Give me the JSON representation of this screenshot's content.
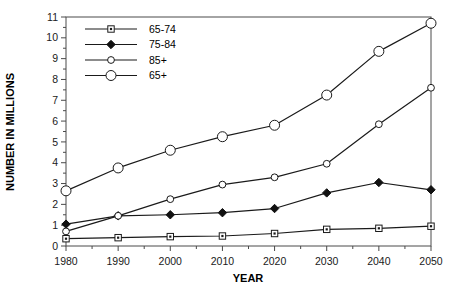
{
  "chart_data": {
    "type": "line",
    "title": "",
    "xlabel": "YEAR",
    "ylabel": "NUMBER IN MILLIONS",
    "x": [
      1980,
      1990,
      2000,
      2010,
      2020,
      2030,
      2040,
      2050
    ],
    "xticklabels": [
      "1980",
      "1990",
      "2000",
      "2010",
      "2020",
      "2030",
      "2040",
      "2050"
    ],
    "yticklabels": [
      "0",
      "1",
      "2",
      "3",
      "4",
      "5",
      "6",
      "7",
      "8",
      "9",
      "10",
      "11"
    ],
    "xlim": [
      1980,
      2050
    ],
    "ylim": [
      0,
      11
    ],
    "grid": false,
    "legend_position": "top-left",
    "series": [
      {
        "name": "65-74",
        "marker": "square-dot",
        "values": [
          0.35,
          0.4,
          0.45,
          0.48,
          0.6,
          0.8,
          0.85,
          0.95
        ]
      },
      {
        "name": "75-84",
        "marker": "filled-diamond",
        "values": [
          1.05,
          1.45,
          1.5,
          1.6,
          1.8,
          2.55,
          3.05,
          2.7
        ]
      },
      {
        "name": "85+",
        "marker": "small-open-circle",
        "values": [
          0.7,
          1.45,
          2.25,
          2.95,
          3.3,
          3.95,
          5.85,
          7.6
        ]
      },
      {
        "name": "65+",
        "marker": "large-open-circle",
        "values": [
          2.65,
          3.75,
          4.6,
          5.25,
          5.8,
          7.25,
          9.35,
          10.7
        ]
      }
    ]
  },
  "colors": {
    "line": "#1a1a1a",
    "frame": "#4a4a4a",
    "background": "#ffffff"
  }
}
